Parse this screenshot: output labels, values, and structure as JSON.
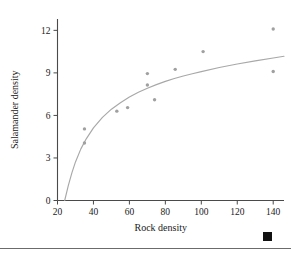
{
  "figure": {
    "corner_marker": "black-square-marker",
    "divider": "bottom-horizontal-rule"
  },
  "chart_data": {
    "type": "scatter",
    "title": "",
    "xlabel": "Rock density",
    "ylabel": "Salamander density",
    "xlim": [
      20,
      146
    ],
    "ylim": [
      0,
      12.8
    ],
    "xticks": [
      20,
      40,
      60,
      80,
      100,
      120,
      140
    ],
    "xtick_labels": [
      "20",
      "40",
      "60",
      "80",
      "100",
      "120",
      "140"
    ],
    "yticks": [
      0,
      3,
      6,
      9,
      12
    ],
    "ytick_labels": [
      "0",
      "3",
      "6",
      "9",
      "12"
    ],
    "grid": false,
    "legend": null,
    "points": [
      {
        "x": 35,
        "y": 5.05
      },
      {
        "x": 35,
        "y": 4.05
      },
      {
        "x": 53,
        "y": 6.3
      },
      {
        "x": 59,
        "y": 6.55
      },
      {
        "x": 70,
        "y": 8.95
      },
      {
        "x": 70,
        "y": 8.15
      },
      {
        "x": 74,
        "y": 7.1
      },
      {
        "x": 85.5,
        "y": 9.25
      },
      {
        "x": 101,
        "y": 10.5
      },
      {
        "x": 140,
        "y": 12.1
      },
      {
        "x": 140,
        "y": 9.1
      }
    ],
    "series": [
      {
        "name": "fitted curve",
        "kind": "line",
        "x": [
          24,
          26,
          28,
          30,
          33,
          36,
          40,
          45,
          50,
          55,
          60,
          65,
          70,
          75,
          80,
          85,
          90,
          95,
          100,
          110,
          120,
          130,
          140,
          146
        ],
        "y": [
          0.0,
          1.05,
          1.95,
          2.72,
          3.64,
          4.35,
          5.12,
          5.86,
          6.44,
          6.9,
          7.3,
          7.63,
          7.92,
          8.17,
          8.4,
          8.6,
          8.78,
          8.94,
          9.09,
          9.38,
          9.63,
          9.85,
          10.05,
          10.17
        ]
      }
    ]
  }
}
